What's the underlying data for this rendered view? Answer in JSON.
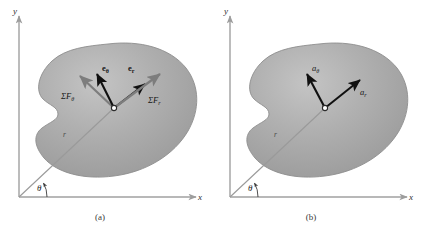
{
  "figure": {
    "background_color": "#ffffff",
    "blob_fill": "#a8a8a8",
    "blob_edge": "#8f8f8f",
    "axis_color": "#a0a0a0",
    "black_vector_color": "#111111",
    "gray_vector_color": "#7d7d7d",
    "radial_line_color": "#9a9a9a"
  },
  "panels": [
    {
      "id": "a",
      "caption": "(a)",
      "axes": {
        "x_label": "x",
        "y_label": "y"
      },
      "angle_label": "θ",
      "radius_label": "r",
      "vectors": [
        {
          "name": "sum-force-theta",
          "label_main": "ΣF",
          "label_sub": "θ",
          "style": "gray",
          "direction_deg": 125
        },
        {
          "name": "unit-vector-theta",
          "label_main": "e",
          "label_sub": "θ",
          "style": "black-bold",
          "direction_deg": 117
        },
        {
          "name": "unit-vector-r",
          "label_main": "e",
          "label_sub": "r",
          "style": "black-bold",
          "direction_deg": 32
        },
        {
          "name": "sum-force-r",
          "label_main": "ΣF",
          "label_sub": "r",
          "style": "gray",
          "direction_deg": 34
        }
      ]
    },
    {
      "id": "b",
      "caption": "(b)",
      "axes": {
        "x_label": "x",
        "y_label": "y"
      },
      "angle_label": "θ",
      "radius_label": "r",
      "vectors": [
        {
          "name": "acceleration-theta",
          "label_main": "a",
          "label_sub": "θ",
          "style": "black-italic",
          "direction_deg": 118
        },
        {
          "name": "acceleration-r",
          "label_main": "a",
          "label_sub": "r",
          "style": "black-italic",
          "direction_deg": 33
        }
      ]
    }
  ]
}
